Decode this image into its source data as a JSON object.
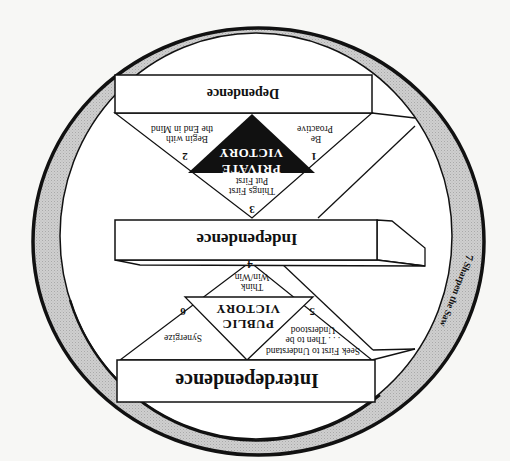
{
  "diagram": {
    "orientation": "rotated 180 degrees",
    "colors": {
      "background": "#f7f7f5",
      "ring": "#c8c8c8",
      "stroke": "#111111",
      "private_victory_fill": "#111111"
    },
    "levels": {
      "dependence": "Dependence",
      "independence": "Independence",
      "interdependence": "Interdependence"
    },
    "private_victory": {
      "line1": "PRIVATE",
      "line2": "VICTORY"
    },
    "public_victory": {
      "line1": "PUBLIC",
      "line2": "VICTORY"
    },
    "habits": [
      {
        "num": "1",
        "lines": [
          "Be",
          "Proactive"
        ]
      },
      {
        "num": "2",
        "lines": [
          "Begin with",
          "the End in Mind"
        ]
      },
      {
        "num": "3",
        "lines": [
          "Put First",
          "Things First"
        ]
      },
      {
        "num": "4",
        "lines": [
          "Think",
          "Win/Win"
        ]
      },
      {
        "num": "5",
        "lines": [
          "Seek First to Understand",
          ". . . Then to be",
          "Understood"
        ]
      },
      {
        "num": "6",
        "lines": [
          "Synergize"
        ]
      },
      {
        "num": "7",
        "lines": [
          "Sharpen the Saw"
        ]
      }
    ]
  }
}
